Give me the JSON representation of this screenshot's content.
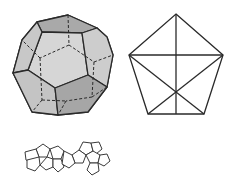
{
  "figure": {
    "colors": {
      "background": "#ffffff",
      "stroke": "#2a2a2a",
      "face_light": "#d4d4d4",
      "face_mid": "#c2c2c2",
      "face_dark": "#a8a8a8"
    },
    "panels": [
      {
        "id": "solid",
        "label": "dodecahedron-3d"
      },
      {
        "id": "pentagon",
        "label": "pentagon-with-diagonals"
      },
      {
        "id": "nets",
        "label": "dodecahedron-nets"
      }
    ]
  }
}
